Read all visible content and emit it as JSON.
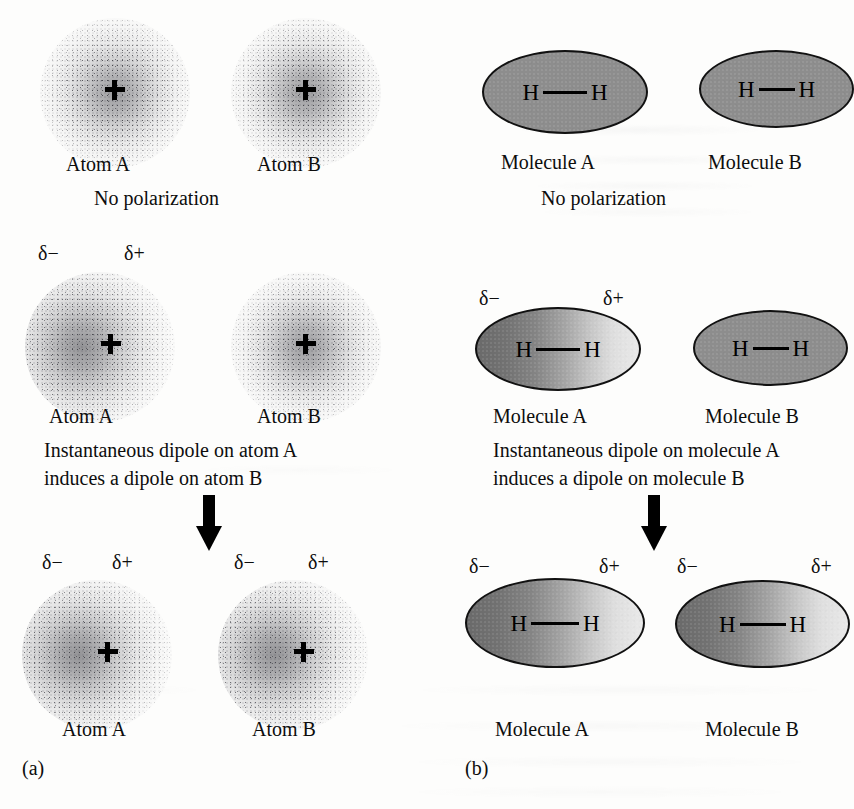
{
  "figure": {
    "panel_a_letter": "(a)",
    "panel_b_letter": "(b)",
    "delta_minus": "δ−",
    "delta_plus": "δ+",
    "colors": {
      "background": "#fdfdfc",
      "ink": "#0d0d0d",
      "molecule_uniform_fill": "#8d8d8d",
      "molecule_gradient_dark": "#6a6a6a",
      "molecule_gradient_light": "#e9e9e9",
      "atom_cloud": "#5f5f64",
      "outline": "#111111"
    }
  },
  "panel_a": {
    "letter": "(a)",
    "rows": [
      {
        "id": "row1",
        "caption": "No polarization",
        "left": {
          "label": "Atom A",
          "polarized": false,
          "delta_minus": null,
          "delta_plus": null
        },
        "right": {
          "label": "Atom B",
          "polarized": false,
          "delta_minus": null,
          "delta_plus": null
        }
      },
      {
        "id": "row2",
        "caption_line1": "Instantaneous dipole on atom A",
        "caption_line2": "induces a dipole on atom B",
        "left": {
          "label": "Atom A",
          "polarized": true,
          "delta_minus": "δ−",
          "delta_plus": "δ+"
        },
        "right": {
          "label": "Atom B",
          "polarized": false,
          "delta_minus": null,
          "delta_plus": null
        }
      },
      {
        "id": "row3",
        "caption": "",
        "left": {
          "label": "Atom A",
          "polarized": true,
          "delta_minus": "δ−",
          "delta_plus": "δ+"
        },
        "right": {
          "label": "Atom B",
          "polarized": true,
          "delta_minus": "δ−",
          "delta_plus": "δ+"
        }
      }
    ]
  },
  "panel_b": {
    "letter": "(b)",
    "bond_atoms": {
      "left": "H",
      "right": "H"
    },
    "rows": [
      {
        "id": "row1",
        "caption": "No polarization",
        "left": {
          "label": "Molecule A",
          "polarized": false,
          "delta_minus": null,
          "delta_plus": null
        },
        "right": {
          "label": "Molecule B",
          "polarized": false,
          "delta_minus": null,
          "delta_plus": null
        }
      },
      {
        "id": "row2",
        "caption_line1": "Instantaneous dipole on molecule A",
        "caption_line2": "induces a dipole on molecule B",
        "left": {
          "label": "Molecule A",
          "polarized": true,
          "delta_minus": "δ−",
          "delta_plus": "δ+"
        },
        "right": {
          "label": "Molecule B",
          "polarized": false,
          "delta_minus": null,
          "delta_plus": null
        }
      },
      {
        "id": "row3",
        "caption": "",
        "left": {
          "label": "Molecule A",
          "polarized": true,
          "delta_minus": "δ−",
          "delta_plus": "δ+"
        },
        "right": {
          "label": "Molecule B",
          "polarized": true,
          "delta_minus": "δ−",
          "delta_plus": "δ+"
        }
      }
    ]
  }
}
